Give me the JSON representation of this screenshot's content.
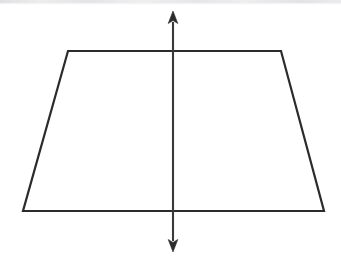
{
  "canvas": {
    "width": 341,
    "height": 269,
    "background_color": "#ffffff",
    "scan_band_color": "#ededee",
    "scan_band_height": 5
  },
  "figure": {
    "title": "Isosceles trapezoid with vertical line of symmetry",
    "stroke_color": "#2b2b2b",
    "stroke_width": 2.2,
    "fill": "none"
  },
  "shapes": {
    "trapezoid": {
      "name": "isosceles-trapezoid",
      "points": "68,51 281,51 324,211 23,211",
      "vertices": [
        {
          "label": "top-left",
          "x": 68,
          "y": 51
        },
        {
          "label": "top-right",
          "x": 281,
          "y": 51
        },
        {
          "label": "bottom-right",
          "x": 324,
          "y": 211
        },
        {
          "label": "bottom-left",
          "x": 23,
          "y": 211
        }
      ],
      "top_base_length": 213,
      "bottom_base_length": 301,
      "height": 160
    },
    "symmetry_axis": {
      "name": "vertical-line-of-symmetry",
      "x": 173,
      "y_top": 11,
      "y_bottom": 252,
      "shaft_top": 22,
      "shaft_bottom": 241,
      "arrowheads": "both",
      "arrowhead_width": 9,
      "arrowhead_length": 12,
      "arrow_up_points": "173,11 177.8,23.5 173,20.6 168.2,23.5",
      "arrow_down_points": "173,252 168.2,239.5 173,242.4 177.8,239.5"
    }
  }
}
